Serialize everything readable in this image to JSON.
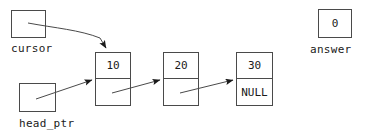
{
  "diagram": {
    "type": "linked-list",
    "width": 382,
    "height": 140,
    "line_color": "#4a4a4a",
    "text_color": "#1a1a1a",
    "background": "#ffffff"
  },
  "pointers": [
    {
      "id": "cursor",
      "label": "cursor",
      "value": "",
      "points_to": "node-1"
    },
    {
      "id": "head_ptr",
      "label": "head_ptr",
      "value": "",
      "points_to": "node-1"
    }
  ],
  "nodes": [
    {
      "id": "node-1",
      "data": "10",
      "next": "",
      "next_label": ""
    },
    {
      "id": "node-2",
      "data": "20",
      "next": "",
      "next_label": ""
    },
    {
      "id": "node-3",
      "data": "30",
      "next": "NULL",
      "next_label": "NULL"
    }
  ],
  "answer": {
    "label": "answer",
    "value": "0"
  }
}
